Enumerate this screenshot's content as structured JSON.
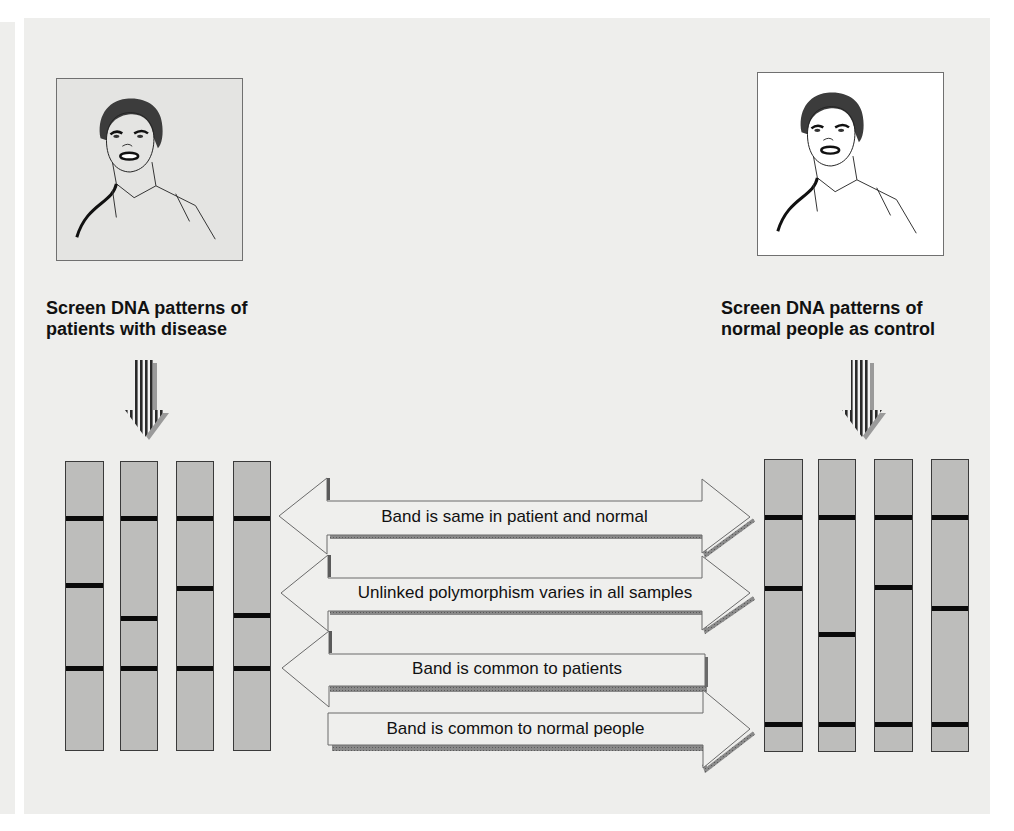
{
  "figure": {
    "left_group": {
      "caption_lines": [
        "Screen DNA patterns of",
        "patients with disease"
      ],
      "portrait_background": "#e4e4e2",
      "lanes": [
        {
          "bands_y": [
            517,
            584,
            667
          ]
        },
        {
          "bands_y": [
            517,
            617,
            667
          ]
        },
        {
          "bands_y": [
            517,
            587,
            667
          ]
        },
        {
          "bands_y": [
            517,
            614,
            667
          ]
        }
      ]
    },
    "right_group": {
      "caption_lines": [
        "Screen DNA patterns of",
        "normal people as control"
      ],
      "portrait_background": "#ffffff",
      "lanes": [
        {
          "bands_y": [
            516,
            587,
            723
          ]
        },
        {
          "bands_y": [
            516,
            633,
            723
          ]
        },
        {
          "bands_y": [
            516,
            586,
            723
          ]
        },
        {
          "bands_y": [
            516,
            607,
            723
          ]
        }
      ]
    },
    "arrows": [
      {
        "label": "Band is same in patient and normal",
        "direction": "both"
      },
      {
        "label": "Unlinked polymorphism varies in all samples",
        "direction": "both"
      },
      {
        "label": "Band is common to patients",
        "direction": "left"
      },
      {
        "label": "Band is common to normal people",
        "direction": "right"
      }
    ],
    "colors": {
      "panel": "#eeeeec",
      "lane_fill": "#bdbdbb",
      "band": "#0a0a0a",
      "arrow_fill": "#efefed",
      "arrow_shadow": "#7a7a7a"
    }
  }
}
